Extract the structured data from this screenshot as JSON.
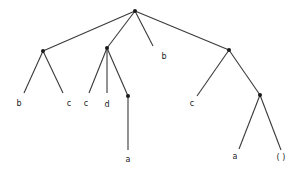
{
  "diagram": {
    "type": "tree",
    "nodes": [
      {
        "id": "root",
        "x": 135,
        "y": 11,
        "internal": true
      },
      {
        "id": "n1",
        "x": 43,
        "y": 51,
        "internal": true
      },
      {
        "id": "n2",
        "x": 107,
        "y": 48,
        "internal": true
      },
      {
        "id": "n3",
        "x": 128,
        "y": 96,
        "internal": true
      },
      {
        "id": "n4",
        "x": 229,
        "y": 50,
        "internal": true
      },
      {
        "id": "n5",
        "x": 260,
        "y": 95,
        "internal": true
      },
      {
        "id": "leaf1",
        "x": 24,
        "y": 93,
        "label": "b",
        "lx": 19,
        "ly": 106
      },
      {
        "id": "leaf2",
        "x": 63,
        "y": 93,
        "label": "c",
        "lx": 69,
        "ly": 106
      },
      {
        "id": "leaf3",
        "x": 89,
        "y": 93,
        "label": "c",
        "lx": 86,
        "ly": 106
      },
      {
        "id": "leaf4",
        "x": 107,
        "y": 93,
        "label": "d",
        "lx": 107,
        "ly": 107
      },
      {
        "id": "leaf5",
        "x": 128,
        "y": 150,
        "label": "a",
        "lx": 128,
        "ly": 162
      },
      {
        "id": "leaf6",
        "x": 153,
        "y": 46,
        "label": "b",
        "lx": 164,
        "ly": 59
      },
      {
        "id": "leaf7",
        "x": 197,
        "y": 96,
        "label": "c",
        "lx": 192,
        "ly": 106
      },
      {
        "id": "leaf8",
        "x": 239,
        "y": 149,
        "label": "a",
        "lx": 235,
        "ly": 159
      },
      {
        "id": "leaf9",
        "x": 281,
        "y": 150,
        "label": "( )",
        "lx": 281,
        "ly": 160
      }
    ],
    "edges": [
      [
        "root",
        "n1"
      ],
      [
        "root",
        "n2"
      ],
      [
        "root",
        "leaf6"
      ],
      [
        "root",
        "n4"
      ],
      [
        "n1",
        "leaf1"
      ],
      [
        "n1",
        "leaf2"
      ],
      [
        "n2",
        "leaf3"
      ],
      [
        "n2",
        "leaf4"
      ],
      [
        "n2",
        "n3"
      ],
      [
        "n3",
        "leaf5"
      ],
      [
        "n4",
        "leaf7"
      ],
      [
        "n4",
        "n5"
      ],
      [
        "n5",
        "leaf8"
      ],
      [
        "n5",
        "leaf9"
      ]
    ],
    "leaf_labels": [
      "b",
      "c",
      "c",
      "d",
      "a",
      "b",
      "c",
      "a",
      "( )"
    ]
  }
}
